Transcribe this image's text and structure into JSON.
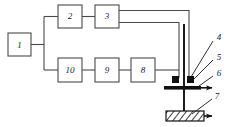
{
  "figure": {
    "type": "block-diagram",
    "stroke_color": "#4a4a4a",
    "accent_color": "#111111",
    "background_color": "#ffffff"
  },
  "blocks": [
    {
      "id": "block-1",
      "label": "1",
      "x": 8,
      "y": 33,
      "w": 23,
      "h": 23
    },
    {
      "id": "block-2",
      "label": "2",
      "x": 58,
      "y": 5,
      "w": 24,
      "h": 23
    },
    {
      "id": "block-3",
      "label": "3",
      "x": 95,
      "y": 5,
      "w": 24,
      "h": 23
    },
    {
      "id": "block-10",
      "label": "10",
      "x": 58,
      "y": 58,
      "w": 24,
      "h": 24
    },
    {
      "id": "block-9",
      "label": "9",
      "x": 95,
      "y": 58,
      "w": 24,
      "h": 24
    },
    {
      "id": "block-8",
      "label": "8",
      "x": 131,
      "y": 58,
      "w": 24,
      "h": 24
    }
  ],
  "callouts": [
    {
      "id": "callout-4",
      "label": "4",
      "x": 219,
      "y": 38
    },
    {
      "id": "callout-5",
      "label": "5",
      "x": 219,
      "y": 58
    },
    {
      "id": "callout-6",
      "label": "6",
      "x": 219,
      "y": 74
    },
    {
      "id": "callout-7",
      "label": "7",
      "x": 217,
      "y": 97
    }
  ],
  "apparatus": {
    "probe_line": {
      "x": 184,
      "y_top": 24,
      "y_bottom": 115
    },
    "electrode_left": {
      "x": 172,
      "y": 76,
      "w": 7,
      "h": 7
    },
    "electrode_right": {
      "x": 187,
      "y": 76,
      "w": 7,
      "h": 7
    },
    "sample_bar": {
      "x": 164,
      "y": 86,
      "w": 37,
      "h": 3.6
    },
    "substrate": {
      "x": 166,
      "y": 111,
      "w": 38,
      "h": 10
    }
  }
}
